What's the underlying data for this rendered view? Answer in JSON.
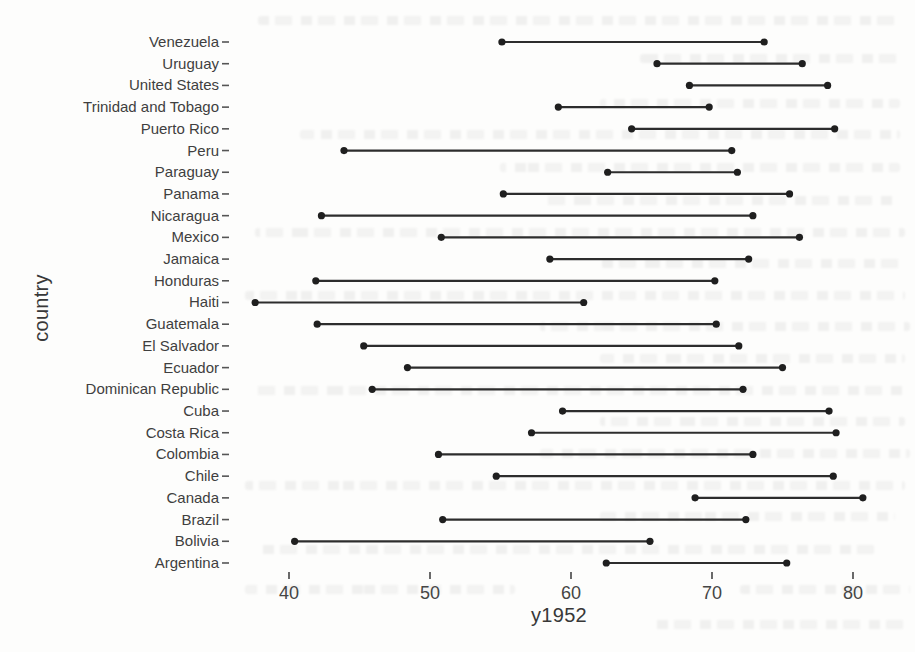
{
  "figure": {
    "background": "#fdfdfc",
    "ink_color": "#2d2d2d",
    "dot_color": "#1f1f1f",
    "text_color": "#3f3f3f"
  },
  "chart_data": {
    "type": "scatter",
    "variant": "dumbbell-range",
    "title": "",
    "xlabel": "y1952",
    "ylabel": "country",
    "grid": false,
    "legend": "none",
    "xticks": [
      40,
      50,
      60,
      70,
      80
    ],
    "xlim": [
      36.5,
      82.5
    ],
    "categories": [
      "Venezuela",
      "Uruguay",
      "United States",
      "Trinidad and Tobago",
      "Puerto Rico",
      "Peru",
      "Paraguay",
      "Panama",
      "Nicaragua",
      "Mexico",
      "Jamaica",
      "Honduras",
      "Haiti",
      "Guatemala",
      "El Salvador",
      "Ecuador",
      "Dominican Republic",
      "Cuba",
      "Costa Rica",
      "Colombia",
      "Chile",
      "Canada",
      "Brazil",
      "Bolivia",
      "Argentina"
    ],
    "series": [
      {
        "name": "segment_start",
        "values": [
          55.1,
          66.1,
          68.4,
          59.1,
          64.3,
          43.9,
          62.6,
          55.2,
          42.3,
          50.8,
          58.5,
          41.9,
          37.6,
          42.0,
          45.3,
          48.4,
          45.9,
          59.4,
          57.2,
          50.6,
          54.7,
          68.8,
          50.9,
          40.4,
          62.5
        ]
      },
      {
        "name": "segment_end",
        "values": [
          73.7,
          76.4,
          78.2,
          69.8,
          78.7,
          71.4,
          71.8,
          75.5,
          72.9,
          76.2,
          72.6,
          70.2,
          60.9,
          70.3,
          71.9,
          75.0,
          72.2,
          78.3,
          78.8,
          72.9,
          78.6,
          80.7,
          72.4,
          65.6,
          75.3
        ]
      }
    ]
  }
}
